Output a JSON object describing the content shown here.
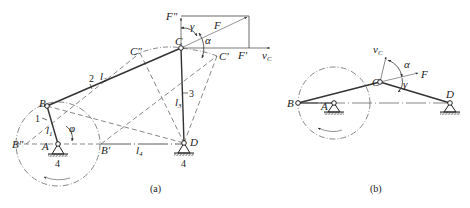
{
  "figure_a": {
    "caption": "(a)",
    "points": {
      "A": "A",
      "B": "B",
      "C": "C",
      "D": "D",
      "B_double_prime": "B\"",
      "B_prime": "B'",
      "C_double_prime": "C\"",
      "C_prime": "C'"
    },
    "links": {
      "link1": "1",
      "link2": "2",
      "link3": "3",
      "ground1": "4",
      "ground2": "4"
    },
    "lengths": {
      "l1": "l",
      "l1_sub": "1",
      "l2": "l",
      "l2_sub": "2",
      "l3": "l",
      "l3_sub": "3",
      "l4": "l",
      "l4_sub": "4"
    },
    "angles": {
      "phi": "φ",
      "gamma": "γ",
      "alpha": "α"
    },
    "forces": {
      "F": "F",
      "F_double_prime": "F\"",
      "F_prime": "F'",
      "vC": "v",
      "vC_sub": "C"
    }
  },
  "figure_b": {
    "caption": "(b)",
    "points": {
      "A": "A",
      "B": "B",
      "C": "C",
      "D": "D"
    },
    "angles": {
      "alpha": "α",
      "gamma": "γ"
    },
    "forces": {
      "F": "F",
      "vC": "v",
      "vC_sub": "C"
    }
  }
}
